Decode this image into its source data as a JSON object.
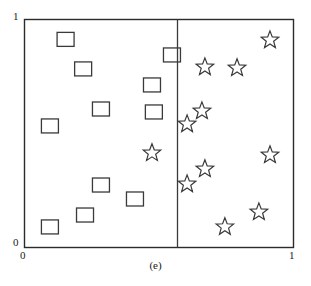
{
  "figure": {
    "caption": "(e)",
    "background_color": "#ffffff",
    "stroke_color": "#3a3a3a",
    "axis_color": "#2b2b2b"
  },
  "axes": {
    "x_min_label": "0",
    "x_max_label": "1",
    "y_min_label": "0",
    "y_max_label": "1",
    "frame": {
      "left": 24,
      "top": 19,
      "right": 294,
      "bottom": 248
    }
  },
  "chart_data": {
    "type": "scatter",
    "title": "",
    "subtitle": "",
    "caption": "(e)",
    "xlabel": "",
    "ylabel": "",
    "xlim": [
      0,
      1
    ],
    "ylim": [
      0,
      1
    ],
    "xticks": [
      0,
      1
    ],
    "yticks": [
      0,
      1
    ],
    "xticklabels": [
      "0",
      "1"
    ],
    "yticklabels": [
      "0",
      "1"
    ],
    "grid": false,
    "legend": false,
    "legend_position": "none",
    "annotations": [
      {
        "name": "vertical-split-line",
        "type": "vline",
        "x": 0.567,
        "y_from": 0.0,
        "y_to": 1.0,
        "color": "#3a3a3a"
      }
    ],
    "series": [
      {
        "name": "squares",
        "marker": "square",
        "filled": false,
        "color": "#3a3a3a",
        "count": 13,
        "points": [
          {
            "x": 0.154,
            "y": 0.911
          },
          {
            "x": 0.219,
            "y": 0.782
          },
          {
            "x": 0.548,
            "y": 0.843
          },
          {
            "x": 0.474,
            "y": 0.712
          },
          {
            "x": 0.285,
            "y": 0.607
          },
          {
            "x": 0.096,
            "y": 0.533
          },
          {
            "x": 0.481,
            "y": 0.594
          },
          {
            "x": 0.285,
            "y": 0.275
          },
          {
            "x": 0.411,
            "y": 0.214
          },
          {
            "x": 0.226,
            "y": 0.144
          },
          {
            "x": 0.096,
            "y": 0.092
          }
        ]
      },
      {
        "name": "stars",
        "marker": "star",
        "filled": false,
        "color": "#3a3a3a",
        "count": 11,
        "points": [
          {
            "x": 0.911,
            "y": 0.908
          },
          {
            "x": 0.67,
            "y": 0.79
          },
          {
            "x": 0.789,
            "y": 0.786
          },
          {
            "x": 0.659,
            "y": 0.598
          },
          {
            "x": 0.604,
            "y": 0.541
          },
          {
            "x": 0.474,
            "y": 0.415
          },
          {
            "x": 0.911,
            "y": 0.406
          },
          {
            "x": 0.67,
            "y": 0.345
          },
          {
            "x": 0.604,
            "y": 0.279
          },
          {
            "x": 0.87,
            "y": 0.157
          },
          {
            "x": 0.744,
            "y": 0.092
          }
        ]
      }
    ]
  }
}
